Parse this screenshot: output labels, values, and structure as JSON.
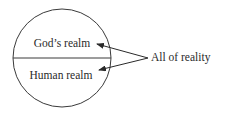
{
  "diagram": {
    "circle": {
      "cx": 62,
      "cy": 58,
      "r": 49,
      "stroke": "#3a3a3a"
    },
    "regions": [
      {
        "label": "God’s realm",
        "x": 62,
        "y": 47
      },
      {
        "label": "Human realm",
        "x": 61,
        "y": 79
      }
    ],
    "annotation": {
      "label": "All of reality",
      "x": 151,
      "y": 61
    },
    "arrows": [
      {
        "from": [
          148,
          58
        ],
        "to": [
          97,
          44
        ]
      },
      {
        "from": [
          148,
          58
        ],
        "to": [
          99,
          70
        ]
      }
    ],
    "colors": {
      "ink": "#2a2a2a",
      "background": "#ffffff"
    }
  }
}
